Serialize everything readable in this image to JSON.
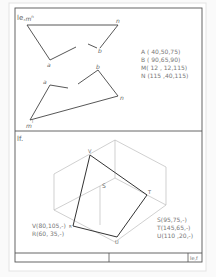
{
  "top_panel": {
    "title": "le,",
    "title_sup_m": "m",
    "title_sup_n": "n",
    "labels": {
      "a1": "a",
      "b1": "b",
      "n1": "n",
      "m2": "m",
      "a2": "a",
      "b2": "b",
      "n2": "n",
      "m2sup": "l"
    },
    "coords": [
      "A ( 40,50,75)",
      "B ( 90,65,90)",
      "M( 12 , 12,115)",
      "N (115 ,40,115)"
    ]
  },
  "bottom_panel": {
    "title": "lf.",
    "labels": {
      "v": "V",
      "t": "T",
      "u": "U",
      "r": "R",
      "s": "S"
    },
    "coords_left": [
      "V(80,105,-)",
      "R(60, 35,-)"
    ],
    "coords_right": [
      "S(95,75,-)",
      "T(145,65,-)",
      "U(110 ,20,-)"
    ]
  },
  "title_strip": {
    "cell_right": "le,f"
  },
  "colors": {
    "frame": "#555555",
    "ink": "#444444",
    "construction": "#bbbbbb",
    "text": "#777777"
  }
}
